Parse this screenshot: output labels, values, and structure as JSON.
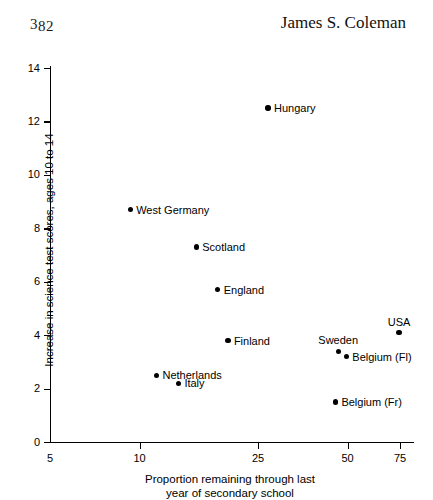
{
  "running_head": {
    "page_number": "382",
    "page_number_digits_high": "3",
    "page_number_digits_low": "82",
    "author": "James S. Coleman"
  },
  "chart_data": {
    "type": "scatter",
    "title": "",
    "xlabel": "Proportion remaining through last year of secondary school",
    "xlabel_line1": "Proportion remaining through last",
    "xlabel_line2": "year of secondary school",
    "ylabel": "Increase in science test scores, ages 10 to 14",
    "xscale": "log",
    "xlim": [
      5,
      78
    ],
    "ylim": [
      0,
      14
    ],
    "xticks": [
      5,
      10,
      25,
      50,
      75
    ],
    "xtick_labels": [
      "5",
      "10",
      "25",
      "50",
      "75"
    ],
    "yticks": [
      0,
      2,
      4,
      6,
      8,
      10,
      12,
      14
    ],
    "ytick_labels": [
      "0",
      "2",
      "4",
      "6",
      "8",
      "10",
      "12",
      "14"
    ],
    "grid": false,
    "legend": "none",
    "marker_color": "#000000",
    "points": [
      {
        "label": "Hungary",
        "x": 27,
        "y": 12.5,
        "label_pos": "right"
      },
      {
        "label": "West Germany",
        "x": 9.3,
        "y": 8.7,
        "label_pos": "right"
      },
      {
        "label": "Scotland",
        "x": 15.5,
        "y": 7.3,
        "label_pos": "right"
      },
      {
        "label": "England",
        "x": 18.3,
        "y": 5.7,
        "label_pos": "right"
      },
      {
        "label": "Finland",
        "x": 19.8,
        "y": 3.8,
        "label_pos": "right"
      },
      {
        "label": "Netherlands",
        "x": 11.4,
        "y": 2.5,
        "label_pos": "right"
      },
      {
        "label": "Italy",
        "x": 13.5,
        "y": 2.2,
        "label_pos": "right"
      },
      {
        "label": "Sweden",
        "x": 46.5,
        "y": 3.4,
        "label_pos": "above"
      },
      {
        "label": "Belgium (Fl)",
        "x": 49.5,
        "y": 3.2,
        "label_pos": "right"
      },
      {
        "label": "Belgium (Fr)",
        "x": 45.5,
        "y": 1.5,
        "label_pos": "right"
      },
      {
        "label": "USA",
        "x": 74.5,
        "y": 4.1,
        "label_pos": "above"
      }
    ]
  }
}
